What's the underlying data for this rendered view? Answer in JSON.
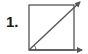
{
  "problem": {
    "number_label": "1."
  },
  "figure": {
    "shape": "square",
    "stroke_color": "#555555",
    "square": {
      "x": 29,
      "y": 5,
      "size": 45
    },
    "diagonal_vector": {
      "from": [
        29,
        50
      ],
      "to": [
        80,
        2
      ],
      "arrowhead": true
    },
    "base_vector": {
      "from": [
        29,
        50
      ],
      "to": [
        82,
        50
      ],
      "arrowhead": true
    },
    "angle_arc": {
      "center": [
        29,
        50
      ],
      "radius": 7,
      "between": [
        "base_vector",
        "diagonal_vector"
      ]
    }
  }
}
